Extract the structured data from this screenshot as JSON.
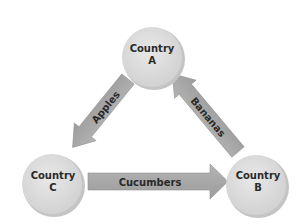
{
  "diagram": {
    "type": "trade-flow-triangle",
    "nodes": [
      {
        "id": "A",
        "line1": "Country",
        "line2": "A"
      },
      {
        "id": "B",
        "line1": "Country",
        "line2": "B"
      },
      {
        "id": "C",
        "line1": "Country",
        "line2": "C"
      }
    ],
    "edges": [
      {
        "from": "A",
        "to": "C",
        "label": "Apples"
      },
      {
        "from": "C",
        "to": "B",
        "label": "Cucumbers"
      },
      {
        "from": "B",
        "to": "A",
        "label": "Bananas"
      }
    ],
    "colors": {
      "node_fill": "#dedede",
      "node_shadow": "#bdbdbd",
      "arrow_fill": "#a9a9a9",
      "arrow_edge": "#8f8f8f",
      "text": "#2a2a2a"
    }
  }
}
